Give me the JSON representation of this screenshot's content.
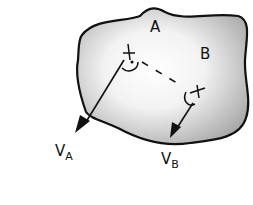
{
  "diagram": {
    "body": {
      "fill": "#c9c9c9",
      "stroke": "#111111"
    },
    "points": [
      {
        "name": "A",
        "label": "A",
        "x": 128,
        "y": 53
      },
      {
        "name": "B",
        "label": "B",
        "x": 195,
        "y": 95
      }
    ],
    "vectors": [
      {
        "name": "V_A",
        "main": "V",
        "sub": "A",
        "from": [
          128,
          53
        ],
        "to": [
          82,
          130
        ]
      },
      {
        "name": "V_B",
        "main": "V",
        "sub": "B",
        "from": [
          193,
          100
        ],
        "to": [
          172,
          138
        ]
      }
    ],
    "connector": "dashed line between A and B"
  }
}
